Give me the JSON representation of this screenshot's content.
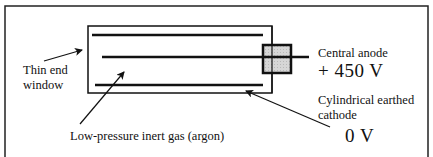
{
  "diagram": {
    "labels": {
      "thin_end_window_line1": "Thin end",
      "thin_end_window_line2": "window",
      "gas": "Low-pressure inert gas (argon)",
      "anode": "Central anode",
      "anode_voltage": "+ 450 V",
      "cathode_line1": "Cylindrical earthed",
      "cathode_line2": "cathode",
      "cathode_voltage": "0 V"
    },
    "colors": {
      "stroke": "#111111",
      "insulator_fill": "#cfcfcf",
      "background": "#ffffff"
    }
  }
}
